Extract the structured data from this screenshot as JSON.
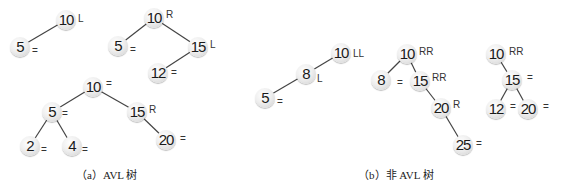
{
  "captions": {
    "a": "（a）AVL 树",
    "b": "（b）非 AVL 树"
  },
  "trees": [
    {
      "id": "a1",
      "group": "a",
      "nodes": [
        {
          "key": "10",
          "x": 66,
          "y": 20,
          "bf": "L",
          "bfx": 78,
          "bfy": 19
        },
        {
          "key": "5",
          "x": 20,
          "y": 47,
          "bf": "=",
          "bfx": 32,
          "bfy": 51
        }
      ],
      "edges": [
        [
          0,
          1
        ]
      ]
    },
    {
      "id": "a2",
      "group": "a",
      "nodes": [
        {
          "key": "10",
          "x": 154,
          "y": 18,
          "bf": "R",
          "bfx": 166,
          "bfy": 15
        },
        {
          "key": "5",
          "x": 118,
          "y": 46,
          "bf": "=",
          "bfx": 130,
          "bfy": 50
        },
        {
          "key": "15",
          "x": 198,
          "y": 47,
          "bf": "L",
          "bfx": 210,
          "bfy": 45
        },
        {
          "key": "12",
          "x": 158,
          "y": 73,
          "bf": "=",
          "bfx": 171,
          "bfy": 73
        }
      ],
      "edges": [
        [
          0,
          1
        ],
        [
          0,
          2
        ],
        [
          2,
          3
        ]
      ]
    },
    {
      "id": "a3",
      "group": "a",
      "nodes": [
        {
          "key": "10",
          "x": 93,
          "y": 87,
          "bf": "=",
          "bfx": 106,
          "bfy": 84
        },
        {
          "key": "5",
          "x": 52,
          "y": 112,
          "bf": "=",
          "bfx": 62,
          "bfy": 114
        },
        {
          "key": "15",
          "x": 137,
          "y": 112,
          "bf": "R",
          "bfx": 149,
          "bfy": 110
        },
        {
          "key": "2",
          "x": 30,
          "y": 146,
          "bf": "=",
          "bfx": 41,
          "bfy": 150
        },
        {
          "key": "4",
          "x": 72,
          "y": 146,
          "bf": "=",
          "bfx": 82,
          "bfy": 150
        },
        {
          "key": "20",
          "x": 166,
          "y": 140,
          "bf": "=",
          "bfx": 180,
          "bfy": 139
        }
      ],
      "edges": [
        [
          0,
          1
        ],
        [
          0,
          2
        ],
        [
          1,
          3
        ],
        [
          1,
          4
        ],
        [
          2,
          5
        ]
      ]
    },
    {
      "id": "b1",
      "group": "b",
      "nodes": [
        {
          "key": "10",
          "x": 341,
          "y": 53,
          "bf": "LL",
          "bfx": 353,
          "bfy": 54
        },
        {
          "key": "8",
          "x": 306,
          "y": 74,
          "bf": "L",
          "bfx": 317,
          "bfy": 79
        },
        {
          "key": "5",
          "x": 265,
          "y": 98,
          "bf": "=",
          "bfx": 277,
          "bfy": 102
        }
      ],
      "edges": [
        [
          0,
          1
        ],
        [
          1,
          2
        ]
      ]
    },
    {
      "id": "b2",
      "group": "b",
      "nodes": [
        {
          "key": "10",
          "x": 407,
          "y": 54,
          "bf": "RR",
          "bfx": 419,
          "bfy": 52
        },
        {
          "key": "8",
          "x": 381,
          "y": 80,
          "bf": "=",
          "bfx": 397,
          "bfy": 83
        },
        {
          "key": "15",
          "x": 420,
          "y": 81,
          "bf": "RR",
          "bfx": 432,
          "bfy": 78
        },
        {
          "key": "20",
          "x": 441,
          "y": 108,
          "bf": "R",
          "bfx": 453,
          "bfy": 105
        },
        {
          "key": "25",
          "x": 463,
          "y": 145,
          "bf": "=",
          "bfx": 476,
          "bfy": 144
        }
      ],
      "edges": [
        [
          0,
          1
        ],
        [
          0,
          2
        ],
        [
          2,
          3
        ],
        [
          3,
          4
        ]
      ]
    },
    {
      "id": "b3",
      "group": "b",
      "nodes": [
        {
          "key": "10",
          "x": 496,
          "y": 54,
          "bf": "RR",
          "bfx": 509,
          "bfy": 52
        },
        {
          "key": "15",
          "x": 512,
          "y": 80,
          "bf": "=",
          "bfx": 527,
          "bfy": 78
        },
        {
          "key": "12",
          "x": 496,
          "y": 109,
          "bf": "=",
          "bfx": 510,
          "bfy": 107
        },
        {
          "key": "20",
          "x": 528,
          "y": 109,
          "bf": "=",
          "bfx": 543,
          "bfy": 107
        }
      ],
      "edges": [
        [
          0,
          1
        ],
        [
          1,
          2
        ],
        [
          1,
          3
        ]
      ]
    }
  ]
}
